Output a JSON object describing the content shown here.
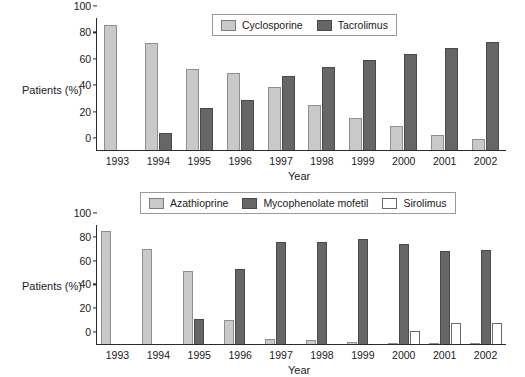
{
  "chart_data": [
    {
      "type": "bar",
      "title": "",
      "xlabel": "Year",
      "ylabel": "Patients (%)",
      "ylim": [
        0,
        100
      ],
      "yticks": [
        0,
        20,
        40,
        60,
        80,
        100
      ],
      "grid": false,
      "legend_position": "top-center",
      "categories": [
        "1993",
        "1994",
        "1995",
        "1996",
        "1997",
        "1998",
        "1999",
        "2000",
        "2001",
        "2002"
      ],
      "series": [
        {
          "name": "Cyclosporine",
          "color": "#c9c9c9",
          "values": [
            95,
            81,
            61,
            58,
            48,
            34,
            24,
            18,
            11,
            8
          ]
        },
        {
          "name": "Tacrolimus",
          "color": "#666666",
          "values": [
            0,
            13,
            32,
            38,
            56,
            63,
            68,
            73,
            77,
            82
          ]
        }
      ]
    },
    {
      "type": "bar",
      "title": "",
      "xlabel": "Year",
      "ylabel": "Patients (%)",
      "ylim": [
        0,
        100
      ],
      "yticks": [
        0,
        20,
        40,
        60,
        80,
        100
      ],
      "grid": false,
      "legend_position": "top-center",
      "categories": [
        "1993",
        "1994",
        "1995",
        "1996",
        "1997",
        "1998",
        "1999",
        "2000",
        "2001",
        "2002"
      ],
      "series": [
        {
          "name": "Azathioprine",
          "color": "#c9c9c9",
          "values": [
            95,
            80,
            61,
            20,
            4,
            3,
            2,
            1,
            1,
            1
          ]
        },
        {
          "name": "Mycophenolate mofetil",
          "color": "#666666",
          "values": [
            0,
            0,
            21,
            63,
            86,
            86,
            88,
            84,
            78,
            79
          ]
        },
        {
          "name": "Sirolimus",
          "color": "#ffffff",
          "values": [
            0,
            0,
            0,
            0,
            0,
            0,
            0,
            11,
            18,
            18
          ]
        }
      ]
    }
  ],
  "panel_top": {
    "ylabel": "Patients (%)",
    "xlabel": "Year",
    "yticks": [
      "0",
      "20",
      "40",
      "60",
      "80",
      "100"
    ],
    "xticks": [
      "1993",
      "1994",
      "1995",
      "1996",
      "1997",
      "1998",
      "1999",
      "2000",
      "2001",
      "2002"
    ],
    "legend": [
      {
        "label": "Cyclosporine",
        "style": "light"
      },
      {
        "label": "Tacrolimus",
        "style": "dark"
      }
    ]
  },
  "panel_bottom": {
    "ylabel": "Patients (%)",
    "xlabel": "Year",
    "yticks": [
      "0",
      "20",
      "40",
      "60",
      "80",
      "100"
    ],
    "xticks": [
      "1993",
      "1994",
      "1995",
      "1996",
      "1997",
      "1998",
      "1999",
      "2000",
      "2001",
      "2002"
    ],
    "legend": [
      {
        "label": "Azathioprine",
        "style": "light"
      },
      {
        "label": "Mycophenolate mofetil",
        "style": "dark"
      },
      {
        "label": "Sirolimus",
        "style": "open"
      }
    ]
  },
  "colors": {
    "light_gray": "#c9c9c9",
    "dark_gray": "#666666",
    "open_white": "#ffffff",
    "axis": "#2b2b2b",
    "background": "#ffffff"
  }
}
